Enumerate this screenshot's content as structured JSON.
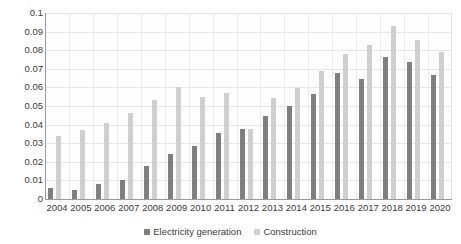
{
  "chart_data": {
    "type": "bar",
    "title": "",
    "xlabel": "",
    "ylabel": "",
    "ylim": [
      0,
      0.1
    ],
    "ytick_labels": [
      "0.1",
      "0.09",
      "0.08",
      "0.07",
      "0.06",
      "0.05",
      "0.04",
      "0.03",
      "0.02",
      "0.01",
      "0"
    ],
    "ytick_values": [
      0.1,
      0.09,
      0.08,
      0.07,
      0.06,
      0.05,
      0.04,
      0.03,
      0.02,
      0.01,
      0
    ],
    "grid": true,
    "legend_position": "bottom",
    "categories": [
      "2004",
      "2005",
      "2006",
      "2007",
      "2008",
      "2009",
      "2010",
      "2011",
      "2012",
      "2013",
      "2014",
      "2015",
      "2016",
      "2017",
      "2018",
      "2019",
      "2020"
    ],
    "series": [
      {
        "name": "Electricity generation",
        "color": "#7f7f7f",
        "values": [
          0.006,
          0.005,
          0.008,
          0.01,
          0.0175,
          0.024,
          0.0285,
          0.0355,
          0.0375,
          0.0445,
          0.05,
          0.0565,
          0.0675,
          0.0645,
          0.0765,
          0.0735,
          0.0665
        ]
      },
      {
        "name": "Construction",
        "color": "#cfcfcf",
        "values": [
          0.034,
          0.037,
          0.041,
          0.0465,
          0.0535,
          0.06,
          0.055,
          0.057,
          0.0375,
          0.0545,
          0.0595,
          0.069,
          0.078,
          0.083,
          0.093,
          0.0855,
          0.079
        ]
      }
    ]
  },
  "legend": {
    "items": [
      {
        "label": "Electricity generation",
        "color": "#7f7f7f"
      },
      {
        "label": "Construction",
        "color": "#cfcfcf"
      }
    ]
  }
}
